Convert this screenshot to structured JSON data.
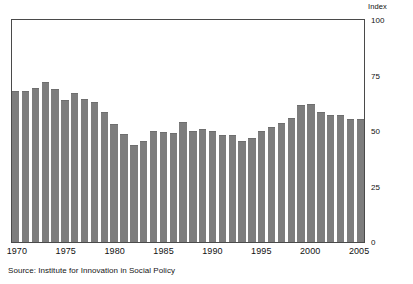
{
  "chart_data": {
    "type": "bar",
    "title": "",
    "subtitle": "",
    "xlabel": "",
    "ylabel": "Index",
    "axis_title": "Index",
    "ylim": [
      0,
      100
    ],
    "xlim": [
      1970,
      2005
    ],
    "grid": false,
    "legend": null,
    "bar_color": "#7d7d7d",
    "frame_color": "#4a4a4a",
    "background": "#ffffff",
    "y_ticks": [
      100,
      75,
      50,
      25,
      0
    ],
    "y_tick_labels": [
      "100",
      "75",
      "50",
      "25",
      "0"
    ],
    "x_ticks": [
      1970,
      1975,
      1980,
      1985,
      1990,
      1995,
      2000,
      2005
    ],
    "x_tick_labels": [
      "1970",
      "1975",
      "1980",
      "1985",
      "1990",
      "1995",
      "2000",
      "2005"
    ],
    "categories": [
      "1970",
      "1971",
      "1972",
      "1973",
      "1974",
      "1975",
      "1976",
      "1977",
      "1978",
      "1979",
      "1980",
      "1981",
      "1982",
      "1983",
      "1984",
      "1985",
      "1986",
      "1987",
      "1988",
      "1989",
      "1990",
      "1991",
      "1992",
      "1993",
      "1994",
      "1995",
      "1996",
      "1997",
      "1998",
      "1999",
      "2000",
      "2001",
      "2002",
      "2003",
      "2004",
      "2005"
    ],
    "values": [
      68,
      68,
      69.5,
      72,
      69,
      64,
      67,
      64.5,
      63,
      58.5,
      53,
      48.5,
      43.5,
      45.5,
      50,
      49.5,
      49,
      54,
      50,
      51,
      50,
      48,
      48,
      45.5,
      47,
      50,
      52,
      53.5,
      56,
      61.5,
      62,
      58.5,
      57,
      57,
      55.5,
      55.5
    ],
    "annotations": []
  },
  "source": {
    "text": "Source: Institute for Innovation in Social Policy"
  }
}
